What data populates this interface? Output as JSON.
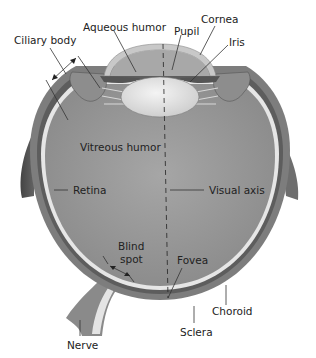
{
  "diagram": {
    "labels": {
      "ciliary_body": "Ciliary body",
      "aqueous_humor": "Aqueous humor",
      "pupil": "Pupil",
      "cornea": "Cornea",
      "iris": "Iris",
      "vitreous_humor": "Vitreous humor",
      "retina": "Retina",
      "visual_axis": "Visual axis",
      "blind_spot_line1": "Blind",
      "blind_spot_line2": "spot",
      "fovea": "Fovea",
      "choroid": "Choroid",
      "sclera": "Sclera",
      "nerve": "Nerve"
    },
    "colors": {
      "sclera": "#7f7f7f",
      "choroid": "#5e5e5e",
      "retina": "#e6e6e6",
      "vitreous": "#9a9a9a",
      "lens": "#e8e8e8",
      "cornea": "#c8c8c8",
      "aqueous": "#a9a9a9",
      "muscle": "#6a6a6a"
    }
  }
}
